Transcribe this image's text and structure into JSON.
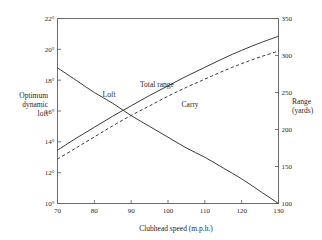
{
  "figure": {
    "background": "#ffffff",
    "ink_color": "#3a3a3a"
  },
  "chart_data": {
    "type": "line",
    "title": "",
    "xlabel": "Clubhead speed (m.p.h.)",
    "ylabel": "Optimum dynamic loft",
    "y2label": "Range (yards)",
    "xlim": [
      70,
      130
    ],
    "ylim": [
      10,
      22
    ],
    "y2lim": [
      100,
      350
    ],
    "grid": false,
    "legend": "inline-curve-labels",
    "xticks": [
      70,
      80,
      90,
      100,
      110,
      120,
      130
    ],
    "xticklabels": [
      "70",
      "80",
      "90",
      "100",
      "110",
      "120",
      "130"
    ],
    "yticks": [
      10,
      12,
      14,
      16,
      18,
      20,
      22
    ],
    "yticklabels": [
      "10°",
      "12°",
      "14°",
      "16°",
      "18°",
      "20°",
      "22°"
    ],
    "y2ticks": [
      100,
      150,
      200,
      250,
      300,
      350
    ],
    "y2ticklabels": [
      "100",
      "150",
      "200",
      "250",
      "300",
      "350"
    ],
    "x": [
      70,
      75,
      80,
      85,
      90,
      95,
      100,
      105,
      110,
      115,
      120,
      125,
      130
    ],
    "series": [
      {
        "name": "Loft",
        "axis": "left",
        "style": "solid",
        "unit": "degrees",
        "values": [
          18.8,
          18.0,
          17.2,
          16.5,
          15.7,
          15.0,
          14.3,
          13.6,
          13.0,
          12.3,
          11.6,
          10.8,
          10.0
        ],
        "label_x": 84,
        "label_y": 16.9
      },
      {
        "name": "Total range",
        "axis": "right",
        "style": "solid",
        "unit": "yards",
        "values": [
          172,
          188,
          203,
          218,
          232,
          246,
          259,
          272,
          284,
          296,
          307,
          317,
          326
        ],
        "label_x": 97,
        "label_y": 258
      },
      {
        "name": "Carry",
        "axis": "right",
        "style": "dashed",
        "unit": "yards",
        "values": [
          160,
          175,
          190,
          205,
          219,
          232,
          245,
          257,
          268,
          279,
          289,
          298,
          306
        ],
        "label_x": 106,
        "label_y": 231
      }
    ]
  }
}
